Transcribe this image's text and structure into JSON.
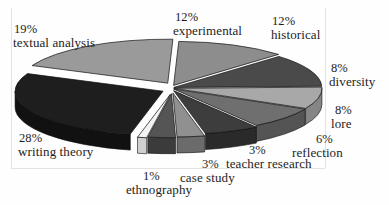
{
  "figure": {
    "background_color": "#fefefe",
    "frame_color": "#e3e3e0",
    "text_color": "#1d1d1d"
  },
  "chart_data": {
    "type": "pie",
    "title": "",
    "subtitle": "",
    "xlabel": "",
    "ylabel": "",
    "style": "3d-exploded-pie",
    "grid": false,
    "legend_position": "none",
    "label_format": "percent-above-name",
    "total": 100,
    "units": "%",
    "categories": [
      "experimental",
      "historical",
      "diversity",
      "lore",
      "reflection",
      "teacher research",
      "case study",
      "ethnography",
      "writing theory",
      "textual analysis"
    ],
    "values": [
      12,
      12,
      8,
      8,
      6,
      3,
      3,
      1,
      28,
      19
    ],
    "slices": [
      {
        "label": "experimental",
        "percent": 12,
        "percent_text": "12%",
        "color": "#8d8d8d",
        "side_color": "#6e6e6e"
      },
      {
        "label": "historical",
        "percent": 12,
        "percent_text": "12%",
        "color": "#4a4a4a",
        "side_color": "#343434"
      },
      {
        "label": "diversity",
        "percent": 8,
        "percent_text": "8%",
        "color": "#a8a8a8",
        "side_color": "#858585"
      },
      {
        "label": "lore",
        "percent": 8,
        "percent_text": "8%",
        "color": "#6f6f6f",
        "side_color": "#545454"
      },
      {
        "label": "reflection",
        "percent": 6,
        "percent_text": "6%",
        "color": "#3d3d3d",
        "side_color": "#2a2a2a"
      },
      {
        "label": "teacher research",
        "percent": 3,
        "percent_text": "3%",
        "color": "#909090",
        "side_color": "#6b6b6b"
      },
      {
        "label": "case study",
        "percent": 3,
        "percent_text": "3%",
        "color": "#555555",
        "side_color": "#3b3b3b"
      },
      {
        "label": "ethnography",
        "percent": 1,
        "percent_text": "1%",
        "color": "#f2f2f2",
        "side_color": "#cfcfcf"
      },
      {
        "label": "writing theory",
        "percent": 28,
        "percent_text": "28%",
        "color": "#1e1e1e",
        "side_color": "#111111"
      },
      {
        "label": "textual analysis",
        "percent": 19,
        "percent_text": "19%",
        "color": "#9a9a9a",
        "side_color": "#767676"
      }
    ]
  },
  "labels": {
    "textual_analysis": {
      "percent": "19%",
      "name": "textual analysis"
    },
    "experimental": {
      "percent": "12%",
      "name": "experimental"
    },
    "historical": {
      "percent": "12%",
      "name": "historical"
    },
    "diversity": {
      "percent": "8%",
      "name": "diversity"
    },
    "lore": {
      "percent": "8%",
      "name": "lore"
    },
    "reflection": {
      "percent": "6%",
      "name": "reflection"
    },
    "teacher_research": {
      "percent": "3%",
      "name": "teacher research"
    },
    "case_study": {
      "percent": "3%",
      "name": "case study"
    },
    "ethnography": {
      "percent": "1%",
      "name": "ethnography"
    },
    "writing_theory": {
      "percent": "28%",
      "name": "writing theory"
    }
  }
}
